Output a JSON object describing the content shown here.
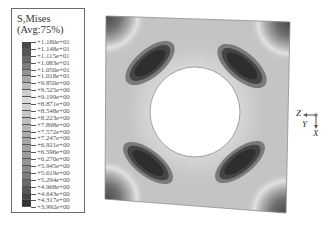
{
  "legend": {
    "title_line1": "S,Mises",
    "title_line2": "(Avg:75%)",
    "values": [
      "+1.180e+01",
      "+1.148e+01",
      "+1.115e+01",
      "+1.083e+01",
      "+1.050e+01",
      "+1.018e+01",
      "+9.850e+00",
      "+9.525e+00",
      "+9.199e+00",
      "+8.871e+00",
      "+8.548e+00",
      "+8.223e+00",
      "+7.898e+00",
      "+7.572e+00",
      "+7.247e+00",
      "+6.921e+00",
      "+6.596e+00",
      "+6.270e+00",
      "+5.945e+00",
      "+5.619e+00",
      "+5.294e+00",
      "+4.968e+00",
      "+4.643e+00",
      "+4.317e+00",
      "+3.992e+00"
    ],
    "segment_colors": [
      "#4a4a4a",
      "#575757",
      "#6a6a6a",
      "#7e7e7e",
      "#939393",
      "#a8a8a8",
      "#bcbcbc",
      "#cdcdcd",
      "#dadada",
      "#d2d2d2",
      "#c7c7c7",
      "#bdbdbd",
      "#b4b4b4",
      "#acacac",
      "#a6a6a6",
      "#a1a1a1",
      "#9c9c9c",
      "#969696",
      "#8c8c8c",
      "#7e7e7e",
      "#6a6a6a",
      "#555555",
      "#444444",
      "#333333"
    ]
  },
  "model": {
    "description": "Square plate with central circular hole, von Mises stress contour",
    "base_color": "#c4c4c4",
    "hole_color": "#ffffff",
    "high_stress_color": "#2e2e2e"
  },
  "triad": {
    "z_label": "Z",
    "y_label": "Y",
    "x_label": "X"
  }
}
